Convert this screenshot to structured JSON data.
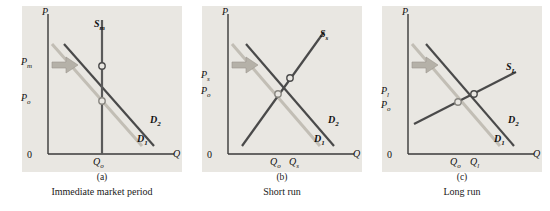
{
  "figure": {
    "panels": [
      {
        "id": "a",
        "letter": "(a)",
        "caption": "Immediate market period",
        "axis_y_label": "P",
        "axis_x_label": "Q",
        "origin_label": "0",
        "supply_label": "S",
        "supply_sub": "m",
        "demand_labels": [
          {
            "text": "D",
            "sub": "1"
          },
          {
            "text": "D",
            "sub": "2"
          }
        ],
        "price_labels": [
          {
            "text": "P",
            "sub": "m"
          },
          {
            "text": "P",
            "sub": "o"
          }
        ],
        "quantity_labels": [
          {
            "text": "Q",
            "sub": "o"
          }
        ]
      },
      {
        "id": "b",
        "letter": "(b)",
        "caption": "Short run",
        "axis_y_label": "P",
        "axis_x_label": "Q",
        "origin_label": "0",
        "supply_label": "S",
        "supply_sub": "s",
        "demand_labels": [
          {
            "text": "D",
            "sub": "1"
          },
          {
            "text": "D",
            "sub": "2"
          }
        ],
        "price_labels": [
          {
            "text": "P",
            "sub": "s"
          },
          {
            "text": "P",
            "sub": "o"
          }
        ],
        "quantity_labels": [
          {
            "text": "Q",
            "sub": "o"
          },
          {
            "text": "Q",
            "sub": "s"
          }
        ]
      },
      {
        "id": "c",
        "letter": "(c)",
        "caption": "Long run",
        "axis_y_label": "P",
        "axis_x_label": "Q",
        "origin_label": "0",
        "supply_label": "S",
        "supply_sub": "L",
        "demand_labels": [
          {
            "text": "D",
            "sub": "1"
          },
          {
            "text": "D",
            "sub": "2"
          }
        ],
        "price_labels": [
          {
            "text": "P",
            "sub": "l"
          },
          {
            "text": "P",
            "sub": "o"
          }
        ],
        "quantity_labels": [
          {
            "text": "Q",
            "sub": "o"
          },
          {
            "text": "Q",
            "sub": "l"
          }
        ]
      }
    ],
    "colors": {
      "panel_background": "#e9e7e2",
      "curve_dark": "#4a4a4a",
      "curve_light": "#b9b5ac",
      "axis": "#3a3a3a",
      "text": "#141414",
      "page_background": "#ffffff"
    }
  }
}
